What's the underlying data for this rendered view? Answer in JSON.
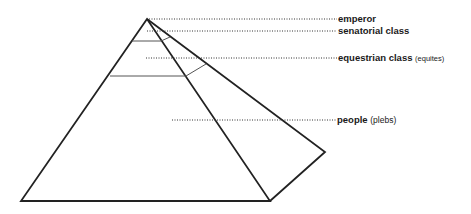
{
  "diagram": {
    "tiers": [
      {
        "id": "emperor",
        "label": "emperor",
        "note": ""
      },
      {
        "id": "senatorial",
        "label": "senatorial class",
        "note": ""
      },
      {
        "id": "equestrian",
        "label": "equestrian class",
        "note": "(equites)"
      },
      {
        "id": "people",
        "label": "people",
        "note": "(plebs)"
      }
    ]
  }
}
